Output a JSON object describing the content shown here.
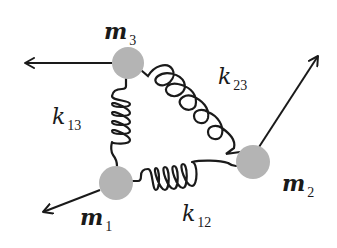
{
  "diagram": {
    "type": "three-mass spring system",
    "colors": {
      "mass_fill": "#b4b4b4",
      "line": "#1a1a1a",
      "background": "#ffffff"
    },
    "masses": [
      {
        "id": "m1",
        "symbol": "m",
        "subscript": "1",
        "cx": 116,
        "cy": 183,
        "r": 17
      },
      {
        "id": "m2",
        "symbol": "m",
        "subscript": "2",
        "cx": 253,
        "cy": 162,
        "r": 17
      },
      {
        "id": "m3",
        "symbol": "m",
        "subscript": "3",
        "cx": 128,
        "cy": 63,
        "r": 16
      }
    ],
    "springs": [
      {
        "id": "k12",
        "symbol": "k",
        "subscript": "12",
        "connects": [
          "m1",
          "m2"
        ]
      },
      {
        "id": "k13",
        "symbol": "k",
        "subscript": "13",
        "connects": [
          "m1",
          "m3"
        ]
      },
      {
        "id": "k23",
        "symbol": "k",
        "subscript": "23",
        "connects": [
          "m2",
          "m3"
        ]
      }
    ],
    "arrows": [
      {
        "from": "m1",
        "direction": "down-left"
      },
      {
        "from": "m2",
        "direction": "up-right"
      },
      {
        "from": "m3",
        "direction": "left"
      }
    ]
  }
}
